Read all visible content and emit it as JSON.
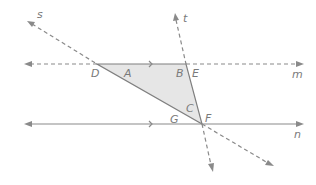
{
  "diagram": {
    "colors": {
      "line": "#8a8a8a",
      "fill": "#e6e6e6",
      "label": "#7a7a7a"
    },
    "lines": [
      {
        "name": "m",
        "label": "m",
        "style": "solid between D and E, dashed elsewhere",
        "parallel_mark": true
      },
      {
        "name": "n",
        "label": "n",
        "style": "solid",
        "parallel_mark": true
      },
      {
        "name": "s",
        "label": "s",
        "style": "dashed outside triangle"
      },
      {
        "name": "t",
        "label": "t",
        "style": "dashed outside triangle"
      }
    ],
    "points": {
      "D": "D",
      "E": "E",
      "F": "F"
    },
    "angles": {
      "A": "A",
      "B": "B",
      "C": "C",
      "G": "G"
    },
    "labels": {
      "s": "s",
      "t": "t",
      "m": "m",
      "n": "n",
      "D": "D",
      "E": "E",
      "F": "F",
      "A": "A",
      "B": "B",
      "C": "C",
      "G": "G"
    }
  }
}
